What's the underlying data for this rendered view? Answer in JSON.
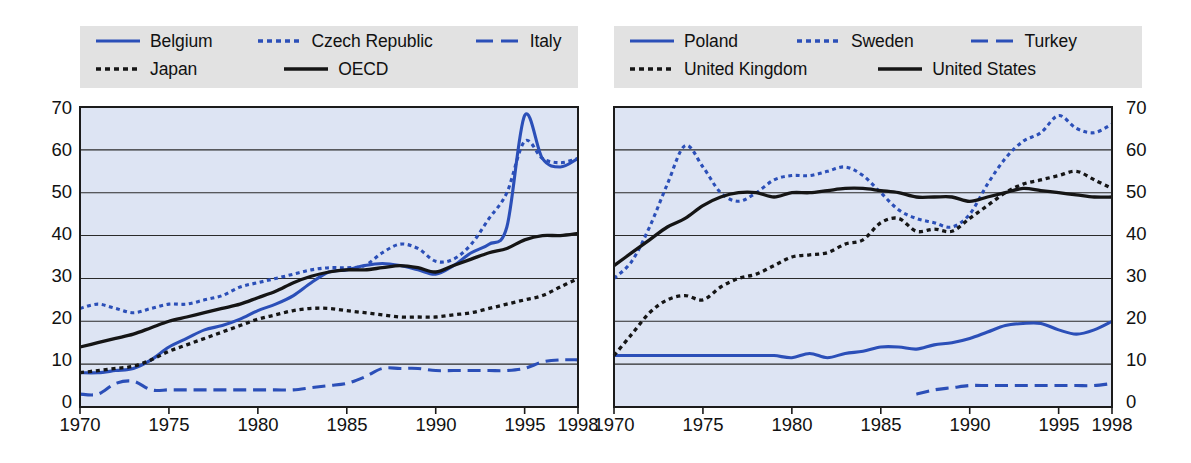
{
  "chart_data": [
    {
      "panel": "left",
      "type": "line",
      "title": "",
      "xlabel": "",
      "ylabel": "",
      "xlim": [
        1970,
        1998
      ],
      "ylim": [
        0,
        70
      ],
      "yticks": [
        0,
        10,
        20,
        30,
        40,
        50,
        60,
        70
      ],
      "xticks": [
        1970,
        1975,
        1980,
        1985,
        1990,
        1995,
        1998
      ],
      "grid": true,
      "legend_position": "top",
      "axis_side": "left",
      "series": [
        {
          "name": "Belgium",
          "color": "#2b4fb8",
          "style": "solid",
          "x": [
            1970,
            1971,
            1972,
            1973,
            1974,
            1975,
            1976,
            1977,
            1978,
            1979,
            1980,
            1981,
            1982,
            1983,
            1984,
            1985,
            1986,
            1987,
            1988,
            1989,
            1990,
            1991,
            1992,
            1993,
            1994,
            1995,
            1996,
            1997,
            1998
          ],
          "values": [
            8,
            8,
            8.5,
            9,
            11,
            14,
            16,
            18,
            19,
            20.5,
            22.5,
            24,
            26,
            29,
            31.5,
            32,
            33,
            33.5,
            33,
            32,
            31,
            33,
            36,
            38,
            42,
            68,
            58,
            56,
            58
          ]
        },
        {
          "name": "Czech Republic",
          "color": "#2b4fb8",
          "style": "dotted",
          "x": [
            1970,
            1971,
            1972,
            1973,
            1974,
            1975,
            1976,
            1977,
            1978,
            1979,
            1980,
            1981,
            1982,
            1983,
            1984,
            1985,
            1986,
            1987,
            1988,
            1989,
            1990,
            1991,
            1992,
            1993,
            1994,
            1995,
            1996,
            1997,
            1998
          ],
          "values": [
            23,
            24,
            23,
            22,
            23,
            24,
            24,
            25,
            26,
            28,
            29,
            30,
            31,
            32,
            32.5,
            32.5,
            33,
            36,
            38,
            37,
            34,
            34.5,
            38,
            44,
            50,
            62,
            58,
            57,
            58
          ]
        },
        {
          "name": "Italy",
          "color": "#2b4fb8",
          "style": "dashed",
          "x": [
            1970,
            1971,
            1972,
            1973,
            1974,
            1975,
            1976,
            1977,
            1978,
            1979,
            1980,
            1981,
            1982,
            1983,
            1984,
            1985,
            1986,
            1987,
            1988,
            1989,
            1990,
            1991,
            1992,
            1993,
            1994,
            1995,
            1996,
            1997,
            1998
          ],
          "values": [
            3,
            3,
            5.5,
            6,
            4,
            4,
            4,
            4,
            4,
            4,
            4,
            4,
            4,
            4.5,
            5,
            5.5,
            7,
            9,
            9,
            9,
            8.5,
            8.5,
            8.5,
            8.5,
            8.5,
            9,
            10.5,
            11,
            11
          ]
        },
        {
          "name": "Japan",
          "color": "#151515",
          "style": "dotted",
          "x": [
            1970,
            1971,
            1972,
            1973,
            1974,
            1975,
            1976,
            1977,
            1978,
            1979,
            1980,
            1981,
            1982,
            1983,
            1984,
            1985,
            1986,
            1987,
            1988,
            1989,
            1990,
            1991,
            1992,
            1993,
            1994,
            1995,
            1996,
            1997,
            1998
          ],
          "values": [
            8,
            8.5,
            9,
            9.5,
            11,
            13,
            14.5,
            16,
            17.5,
            19,
            20.5,
            21.5,
            22.5,
            23,
            23,
            22.5,
            22,
            21.5,
            21,
            21,
            21,
            21.5,
            22,
            23,
            24,
            25,
            26,
            28,
            30
          ]
        },
        {
          "name": "OECD",
          "color": "#151515",
          "style": "solid",
          "x": [
            1970,
            1971,
            1972,
            1973,
            1974,
            1975,
            1976,
            1977,
            1978,
            1979,
            1980,
            1981,
            1982,
            1983,
            1984,
            1985,
            1986,
            1987,
            1988,
            1989,
            1990,
            1991,
            1992,
            1993,
            1994,
            1995,
            1996,
            1997,
            1998
          ],
          "values": [
            14,
            15,
            16,
            17,
            18.5,
            20,
            21,
            22,
            23,
            24,
            25.5,
            27,
            29,
            30.5,
            31.5,
            32,
            32,
            32.5,
            33,
            32.5,
            31.5,
            33,
            34.5,
            36,
            37,
            39,
            40,
            40,
            40.5
          ]
        }
      ]
    },
    {
      "panel": "right",
      "type": "line",
      "title": "",
      "xlabel": "",
      "ylabel": "",
      "xlim": [
        1970,
        1998
      ],
      "ylim": [
        0,
        70
      ],
      "yticks": [
        0,
        10,
        20,
        30,
        40,
        50,
        60,
        70
      ],
      "xticks": [
        1970,
        1975,
        1980,
        1985,
        1990,
        1995,
        1998
      ],
      "grid": true,
      "legend_position": "top",
      "axis_side": "right",
      "series": [
        {
          "name": "Poland",
          "color": "#2b4fb8",
          "style": "solid",
          "x": [
            1970,
            1971,
            1972,
            1973,
            1974,
            1975,
            1976,
            1977,
            1978,
            1979,
            1980,
            1981,
            1982,
            1983,
            1984,
            1985,
            1986,
            1987,
            1988,
            1989,
            1990,
            1991,
            1992,
            1993,
            1994,
            1995,
            1996,
            1997,
            1998
          ],
          "values": [
            12,
            12,
            12,
            12,
            12,
            12,
            12,
            12,
            12,
            12,
            11.5,
            12.5,
            11.5,
            12.5,
            13,
            14,
            14,
            13.5,
            14.5,
            15,
            16,
            17.5,
            19,
            19.5,
            19.5,
            18,
            17,
            18,
            20
          ]
        },
        {
          "name": "Sweden",
          "color": "#2b4fb8",
          "style": "dotted",
          "x": [
            1970,
            1971,
            1972,
            1973,
            1974,
            1975,
            1976,
            1977,
            1978,
            1979,
            1980,
            1981,
            1982,
            1983,
            1984,
            1985,
            1986,
            1987,
            1988,
            1989,
            1990,
            1991,
            1992,
            1993,
            1994,
            1995,
            1996,
            1997,
            1998
          ],
          "values": [
            30,
            34,
            42,
            52,
            61,
            56,
            50,
            48,
            50,
            53,
            54,
            54,
            55,
            56,
            54,
            50,
            46,
            44,
            43,
            42,
            45,
            52,
            58,
            62,
            64,
            68,
            65,
            64,
            66
          ]
        },
        {
          "name": "Turkey",
          "color": "#2b4fb8",
          "style": "dashed",
          "x": [
            1987,
            1988,
            1989,
            1990,
            1991,
            1992,
            1993,
            1994,
            1995,
            1996,
            1997,
            1998
          ],
          "values": [
            3,
            4,
            4.5,
            5,
            5,
            5,
            5,
            5,
            5,
            5,
            5,
            5.5
          ]
        },
        {
          "name": "United Kingdom",
          "color": "#151515",
          "style": "dotted",
          "x": [
            1970,
            1971,
            1972,
            1973,
            1974,
            1975,
            1976,
            1977,
            1978,
            1979,
            1980,
            1981,
            1982,
            1983,
            1984,
            1985,
            1986,
            1987,
            1988,
            1989,
            1990,
            1991,
            1992,
            1993,
            1994,
            1995,
            1996,
            1997,
            1998
          ],
          "values": [
            12,
            17,
            22,
            25,
            26,
            25,
            28,
            30,
            31,
            33,
            35,
            35.5,
            36,
            38,
            39,
            43,
            44,
            41,
            41.5,
            41,
            44,
            47,
            50,
            52,
            53,
            54,
            55,
            53,
            51
          ]
        },
        {
          "name": "United States",
          "color": "#151515",
          "style": "solid",
          "x": [
            1970,
            1971,
            1972,
            1973,
            1974,
            1975,
            1976,
            1977,
            1978,
            1979,
            1980,
            1981,
            1982,
            1983,
            1984,
            1985,
            1986,
            1987,
            1988,
            1989,
            1990,
            1991,
            1992,
            1993,
            1994,
            1995,
            1996,
            1997,
            1998
          ],
          "values": [
            33,
            36,
            39,
            42,
            44,
            47,
            49,
            50,
            50,
            49,
            50,
            50,
            50.5,
            51,
            51,
            50.5,
            50,
            49,
            49,
            49,
            48,
            49,
            50,
            51,
            50.5,
            50,
            49.5,
            49,
            49
          ]
        }
      ]
    }
  ],
  "panels": {
    "left": {
      "legend": {
        "rows": [
          [
            {
              "label": "Belgium",
              "key": "solid-blue-line-key"
            },
            {
              "label": "Czech Republic",
              "key": "dotted-blue-line-key"
            },
            {
              "label": "Italy",
              "key": "dashed-blue-line-key"
            }
          ],
          [
            {
              "label": "Japan",
              "key": "dotted-black-line-key"
            },
            {
              "label": "OECD",
              "key": "solid-black-line-key"
            }
          ]
        ]
      },
      "ytick_labels": [
        "70",
        "60",
        "50",
        "40",
        "30",
        "20",
        "10",
        "0"
      ],
      "xtick_labels": [
        "1970",
        "1975",
        "1980",
        "1985",
        "1990",
        "1995",
        "1998"
      ]
    },
    "right": {
      "legend": {
        "rows": [
          [
            {
              "label": "Poland",
              "key": "solid-blue-line-key"
            },
            {
              "label": "Sweden",
              "key": "dotted-blue-line-key"
            },
            {
              "label": "Turkey",
              "key": "dashed-blue-line-key"
            }
          ],
          [
            {
              "label": "United Kingdom",
              "key": "dotted-black-line-key"
            },
            {
              "label": "United States",
              "key": "solid-black-line-key"
            }
          ]
        ]
      },
      "ytick_labels": [
        "70",
        "60",
        "50",
        "40",
        "30",
        "20",
        "10",
        "0"
      ],
      "xtick_labels": [
        "1970",
        "1975",
        "1980",
        "1985",
        "1990",
        "1995",
        "1998"
      ]
    }
  },
  "colors": {
    "blue_series": "#2b4fb8",
    "black_series": "#151515",
    "plot_background": "#dde4f3",
    "legend_background": "#e2e2e2",
    "page_background": "#ffffff"
  }
}
